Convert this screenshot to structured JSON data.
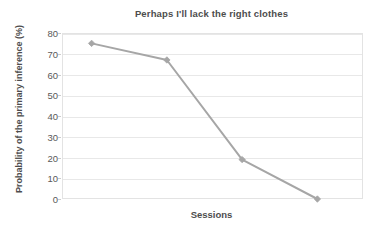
{
  "chart_data": {
    "type": "line",
    "title": "Perhaps I'll lack the right clothes",
    "xlabel": "Sessions",
    "ylabel": "Probability of the primary inference (%)",
    "x": [
      1,
      2,
      3,
      4
    ],
    "values": [
      75,
      67,
      19,
      0
    ],
    "series": [
      {
        "name": "Probability of the primary inference (%)",
        "values": [
          75,
          67,
          19,
          0
        ]
      }
    ],
    "ylim": [
      0,
      80
    ],
    "ytick_labels": [
      "80",
      "70",
      "60",
      "50",
      "40",
      "30",
      "20",
      "10",
      "0"
    ],
    "yticks": [
      80,
      70,
      60,
      50,
      40,
      30,
      20,
      10,
      0
    ],
    "xtick_labels": [],
    "grid": "horizontal",
    "legend": "none",
    "line_color": "#a6a6a6",
    "marker": "diamond",
    "marker_color": "#a6a6a6",
    "plot_background": "#ffffff",
    "gridline_color": "#e8e8e8",
    "text_color": "#4d4d4d"
  }
}
